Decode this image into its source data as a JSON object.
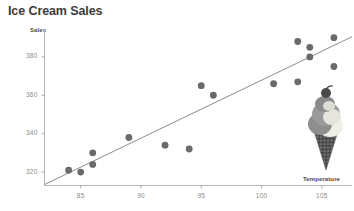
{
  "chart_data": {
    "type": "scatter",
    "title": "Ice Cream Sales",
    "xlabel": "Temperature",
    "ylabel": "Sales",
    "xlim": [
      82,
      107.5
    ],
    "ylim": [
      313,
      394
    ],
    "xticks": [
      85,
      90,
      95,
      100,
      105
    ],
    "yticks": [
      320,
      340,
      360,
      380
    ],
    "grid": false,
    "legend": null,
    "marker_color": "#6a6a6a",
    "trendline_color": "#8c8c8c",
    "axis_color": "#b0b0b0",
    "points": [
      {
        "x": 84,
        "y": 321
      },
      {
        "x": 85,
        "y": 320
      },
      {
        "x": 86,
        "y": 330
      },
      {
        "x": 86,
        "y": 324
      },
      {
        "x": 89,
        "y": 338
      },
      {
        "x": 92,
        "y": 334
      },
      {
        "x": 94,
        "y": 332
      },
      {
        "x": 95,
        "y": 365
      },
      {
        "x": 96,
        "y": 360
      },
      {
        "x": 101,
        "y": 366
      },
      {
        "x": 103,
        "y": 367
      },
      {
        "x": 103,
        "y": 388
      },
      {
        "x": 104,
        "y": 385
      },
      {
        "x": 104,
        "y": 380
      },
      {
        "x": 106,
        "y": 375
      },
      {
        "x": 106,
        "y": 390
      }
    ],
    "trendline": {
      "x0": 82,
      "y0": 313.5,
      "x1": 107.5,
      "y1": 390.5
    }
  },
  "decoration": {
    "ice_cream_cone": "ice-cream-cone-illustration"
  }
}
